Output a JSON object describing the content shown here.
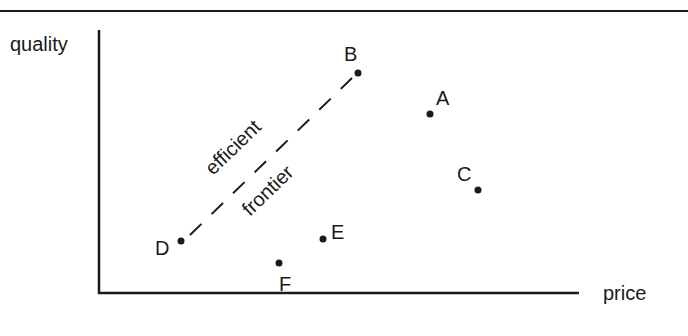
{
  "diagram": {
    "axes": {
      "y_label": "quality",
      "x_label": "price"
    },
    "frontier": {
      "label_line1": "efficient",
      "label_line2": "frontier",
      "from": "D",
      "to": "B",
      "style": "dashed"
    },
    "points": [
      {
        "id": "A",
        "label": "A",
        "x": 430,
        "y": 114,
        "lx": 436,
        "ly": 105
      },
      {
        "id": "B",
        "label": "B",
        "x": 358,
        "y": 73,
        "lx": 344,
        "ly": 61
      },
      {
        "id": "C",
        "label": "C",
        "x": 478,
        "y": 190,
        "lx": 457,
        "ly": 181
      },
      {
        "id": "D",
        "label": "D",
        "x": 181,
        "y": 241,
        "lx": 155,
        "ly": 255
      },
      {
        "id": "E",
        "label": "E",
        "x": 323,
        "y": 239,
        "lx": 331,
        "ly": 239
      },
      {
        "id": "F",
        "label": "F",
        "x": 279,
        "y": 263,
        "lx": 279,
        "ly": 291
      }
    ],
    "colors": {
      "ink": "#1a1a1a",
      "background": "#ffffff"
    }
  }
}
